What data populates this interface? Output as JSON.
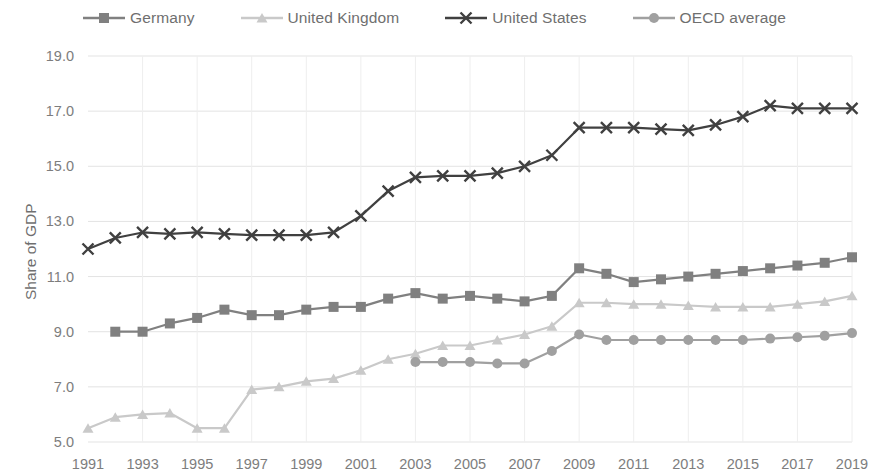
{
  "chart_data": {
    "type": "line",
    "title": "",
    "subtitle": "",
    "xlabel": "",
    "ylabel": "Share of GDP",
    "xlim": [
      1991,
      2019
    ],
    "ylim": [
      5.0,
      19.0
    ],
    "ytick_step": 2.0,
    "xtick_step": 2,
    "grid": true,
    "legend_position": "top",
    "yticks": [
      "19.0",
      "17.0",
      "15.0",
      "13.0",
      "11.0",
      "9.0",
      "7.0",
      "5.0"
    ],
    "ytick_values": [
      19.0,
      17.0,
      15.0,
      13.0,
      11.0,
      9.0,
      7.0,
      5.0
    ],
    "xticks": [
      "1991",
      "1993",
      "1995",
      "1997",
      "1999",
      "2001",
      "2003",
      "2005",
      "2007",
      "2009",
      "2011",
      "2013",
      "2015",
      "2017",
      "2019"
    ],
    "xtick_values": [
      1991,
      1993,
      1995,
      1997,
      1999,
      2001,
      2003,
      2005,
      2007,
      2009,
      2011,
      2013,
      2015,
      2017,
      2019
    ],
    "series": [
      {
        "name": "Germany",
        "color": "#808080",
        "marker": "square",
        "x": [
          1992,
          1993,
          1994,
          1995,
          1996,
          1997,
          1998,
          1999,
          2000,
          2001,
          2002,
          2003,
          2004,
          2005,
          2006,
          2007,
          2008,
          2009,
          2010,
          2011,
          2012,
          2013,
          2014,
          2015,
          2016,
          2017,
          2018,
          2019
        ],
        "values": [
          9.0,
          9.0,
          9.3,
          9.5,
          9.8,
          9.6,
          9.6,
          9.8,
          9.9,
          9.9,
          10.2,
          10.4,
          10.2,
          10.3,
          10.2,
          10.1,
          10.3,
          11.3,
          11.1,
          10.8,
          10.9,
          11.0,
          11.1,
          11.2,
          11.3,
          11.4,
          11.5,
          11.7
        ]
      },
      {
        "name": "United Kingdom",
        "color": "#c9c9c9",
        "marker": "triangle",
        "x": [
          1991,
          1992,
          1993,
          1994,
          1995,
          1996,
          1997,
          1998,
          1999,
          2000,
          2001,
          2002,
          2003,
          2004,
          2005,
          2006,
          2007,
          2008,
          2009,
          2010,
          2011,
          2012,
          2013,
          2014,
          2015,
          2016,
          2017,
          2018,
          2019
        ],
        "values": [
          5.5,
          5.9,
          6.0,
          6.05,
          5.5,
          5.5,
          6.9,
          7.0,
          7.2,
          7.3,
          7.6,
          8.0,
          8.2,
          8.5,
          8.5,
          8.7,
          8.9,
          9.2,
          10.05,
          10.05,
          10.0,
          10.0,
          9.95,
          9.9,
          9.9,
          9.9,
          10.0,
          10.1,
          10.3
        ]
      },
      {
        "name": "United States",
        "color": "#404040",
        "marker": "cross",
        "x": [
          1991,
          1992,
          1993,
          1994,
          1995,
          1996,
          1997,
          1998,
          1999,
          2000,
          2001,
          2002,
          2003,
          2004,
          2005,
          2006,
          2007,
          2008,
          2009,
          2010,
          2011,
          2012,
          2013,
          2014,
          2015,
          2016,
          2017,
          2018,
          2019
        ],
        "values": [
          12.0,
          12.4,
          12.6,
          12.55,
          12.6,
          12.55,
          12.5,
          12.5,
          12.5,
          12.6,
          13.2,
          14.1,
          14.6,
          14.65,
          14.65,
          14.75,
          15.0,
          15.4,
          16.4,
          16.4,
          16.4,
          16.35,
          16.3,
          16.5,
          16.8,
          17.2,
          17.1,
          17.1,
          17.1
        ]
      },
      {
        "name": "OECD average",
        "color": "#a0a0a0",
        "marker": "circle",
        "x": [
          2003,
          2004,
          2005,
          2006,
          2007,
          2008,
          2009,
          2010,
          2011,
          2012,
          2013,
          2014,
          2015,
          2016,
          2017,
          2018,
          2019
        ],
        "values": [
          7.9,
          7.9,
          7.9,
          7.85,
          7.85,
          8.3,
          8.9,
          8.7,
          8.7,
          8.7,
          8.7,
          8.7,
          8.7,
          8.75,
          8.8,
          8.85,
          8.95
        ]
      }
    ]
  },
  "legend": {
    "items": [
      {
        "label": "Germany",
        "color": "#808080",
        "marker": "square"
      },
      {
        "label": "United Kingdom",
        "color": "#c9c9c9",
        "marker": "triangle"
      },
      {
        "label": "United States",
        "color": "#404040",
        "marker": "cross"
      },
      {
        "label": "OECD average",
        "color": "#a0a0a0",
        "marker": "circle"
      }
    ]
  },
  "axes": {
    "y_title": "Share of GDP"
  }
}
